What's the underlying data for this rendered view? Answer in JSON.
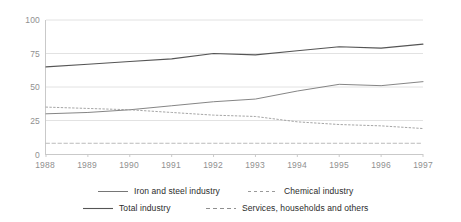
{
  "chart_data": {
    "type": "line",
    "title": "",
    "subtitle": "",
    "xlabel": "",
    "ylabel": "",
    "x": [
      "1988",
      "1989",
      "1990",
      "1991",
      "1992",
      "1993",
      "1994",
      "1995",
      "1996",
      "1997"
    ],
    "categories": [
      "1988",
      "1989",
      "1990",
      "1991",
      "1992",
      "1993",
      "1994",
      "1995",
      "1996",
      "1997"
    ],
    "ylim": [
      0,
      100
    ],
    "xlim": [
      "1988",
      "1997"
    ],
    "y_ticks": [
      0,
      25,
      50,
      75,
      100
    ],
    "y_tick_labels": [
      "0",
      "25",
      "50",
      "75",
      "100"
    ],
    "grid": true,
    "grid_axis": "y",
    "legend_position": "bottom",
    "series": [
      {
        "name": "Total industry",
        "style": "solid",
        "color": "#555555",
        "width": 1.1,
        "values": [
          65,
          67,
          69,
          71,
          75,
          74,
          77,
          80,
          79,
          82
        ]
      },
      {
        "name": "Iron and steel industry",
        "style": "solid",
        "color": "#767676",
        "width": 0.9,
        "values": [
          30,
          31,
          33,
          36,
          39,
          41,
          47,
          52,
          51,
          54
        ]
      },
      {
        "name": "Chemical industry",
        "style": "dotted",
        "color": "#9a9a9a",
        "width": 0.9,
        "values": [
          35,
          34,
          33,
          31,
          29,
          28,
          24,
          22,
          21,
          19
        ]
      },
      {
        "name": "Services, households and others",
        "style": "dashed",
        "color": "#b4b4b4",
        "width": 0.9,
        "values": [
          8,
          8,
          8,
          8,
          8,
          8,
          8,
          8,
          8,
          8
        ]
      }
    ]
  },
  "legend": {
    "items": [
      {
        "label": "Iron and steel industry",
        "style": "solid",
        "color": "#767676"
      },
      {
        "label": "Chemical industry",
        "style": "dotted",
        "color": "#9a9a9a"
      },
      {
        "label": "Total industry",
        "style": "solid",
        "color": "#555555"
      },
      {
        "label": "Services, households and others",
        "style": "dashed",
        "color": "#b4b4b4"
      }
    ]
  },
  "axes": {
    "y_labels": [
      "100",
      "75",
      "50",
      "25",
      "0"
    ],
    "x_labels": [
      "1988",
      "1989",
      "1990",
      "1991",
      "1992",
      "1993",
      "1994",
      "1995",
      "1996",
      "1997"
    ]
  },
  "colors": {
    "axis": "#c9c9c9",
    "grid": "#e2e2e2",
    "tick_text": "#909090",
    "legend_text": "#2b2b2b",
    "background": "#ffffff"
  }
}
